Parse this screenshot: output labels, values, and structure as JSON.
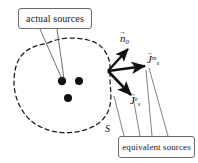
{
  "figure": {
    "type": "diagram",
    "background_color": "#ffffff",
    "ink_color": "#111111",
    "callouts": [
      {
        "id": "actual-sources",
        "label": "actual sources",
        "points_to": "interior source dots"
      },
      {
        "id": "equivalent-sources",
        "label": "equivalent sources",
        "points_to": "surface current vectors"
      }
    ],
    "surface": {
      "label": "S",
      "style": "dashed",
      "closed": true
    },
    "vectors": [
      {
        "id": "n0",
        "symbol": "n",
        "subscript": "0",
        "superscript": "",
        "accent": "arrow",
        "meaning": "outward unit normal"
      },
      {
        "id": "jsm",
        "symbol": "J",
        "subscript": "s",
        "superscript": "m",
        "accent": "arrow",
        "meaning": "equivalent magnetic surface current"
      },
      {
        "id": "jse",
        "symbol": "J",
        "subscript": "s",
        "superscript": "e",
        "accent": "arrow",
        "meaning": "equivalent electric surface current"
      }
    ],
    "source_points": [
      {
        "id": "source-dot-1",
        "x": 62,
        "y": 81
      },
      {
        "id": "source-dot-2",
        "x": 79,
        "y": 81
      },
      {
        "id": "source-dot-3",
        "x": 68,
        "y": 98
      }
    ],
    "vector_origin": {
      "x": 108,
      "y": 71
    }
  }
}
